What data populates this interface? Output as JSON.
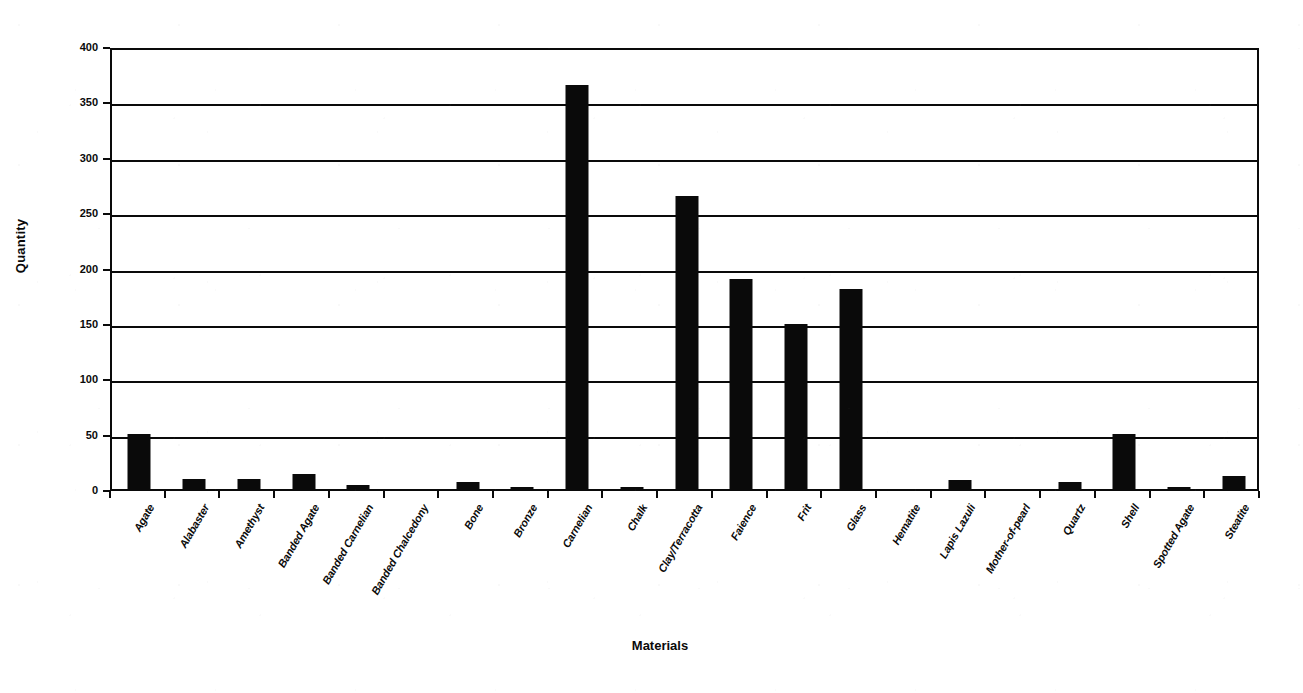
{
  "chart_data": {
    "type": "bar",
    "title": "",
    "xlabel": "Materials",
    "ylabel": "Quantity",
    "ylim": [
      0,
      400
    ],
    "yticks": [
      0,
      50,
      100,
      150,
      200,
      250,
      300,
      350,
      400
    ],
    "ytick_labels": [
      "0",
      "50",
      "100",
      "150",
      "200",
      "250",
      "300",
      "350",
      "400"
    ],
    "grid": true,
    "legend": null,
    "bar_color": "#0a0a0a",
    "categories": [
      "Agate",
      "Alabaster",
      "Amethyst",
      "Banded Agate",
      "Banded Carnelian",
      "Banded Chalcedony",
      "Bone",
      "Bronze",
      "Carnelian",
      "Chalk",
      "Clay/Terracotta",
      "Faience",
      "Frit",
      "Glass",
      "Hematite",
      "Lapis Lazuli",
      "Mother-of-pearl",
      "Quartz",
      "Shell",
      "Spotted Agate",
      "Steatite"
    ],
    "values": [
      50,
      9,
      9,
      14,
      4,
      0,
      6,
      2,
      365,
      2,
      265,
      190,
      149,
      181,
      0,
      8,
      0,
      6,
      50,
      1,
      12
    ]
  }
}
